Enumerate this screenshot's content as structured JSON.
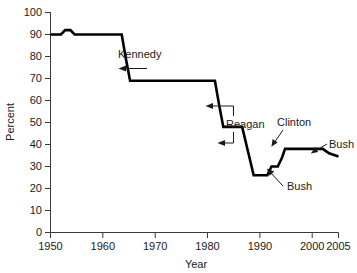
{
  "chart_data": {
    "type": "line",
    "title": "",
    "xlabel": "Year",
    "ylabel": "Percent",
    "xlim": [
      1950,
      2005
    ],
    "ylim": [
      0,
      100
    ],
    "grid": false,
    "legend": "none",
    "xticks": [
      1950,
      1960,
      1970,
      1980,
      1990,
      2000,
      2005
    ],
    "xtick_labels": [
      "1950",
      "1960",
      "1970",
      "1980",
      "1990",
      "2000",
      "2005"
    ],
    "yticks": [
      0,
      10,
      20,
      30,
      40,
      50,
      60,
      70,
      80,
      90,
      100
    ],
    "ytick_labels": [
      "0",
      "10",
      "20",
      "30",
      "40",
      "50",
      "60",
      "70",
      "80",
      "90",
      "100"
    ],
    "series": [
      {
        "name": "Percent",
        "color": "#000000",
        "x": [
          1950,
          1952,
          1952.8,
          1953.8,
          1954.6,
          1963.6,
          1964.4,
          1965.2,
          1981.4,
          1982.2,
          1983.0,
          1986.6,
          1987.4,
          1988.8,
          1991.4,
          1992.2,
          1993.4,
          1994.2,
          1994.8,
          1995.6,
          2002.0,
          2003.2,
          2005.0
        ],
        "y": [
          90,
          90,
          92,
          92,
          90,
          90,
          79,
          69,
          69,
          58,
          48,
          48,
          40,
          26,
          26,
          30,
          30,
          34,
          38,
          38,
          38,
          36,
          34.5
        ]
      }
    ],
    "annotations": [
      {
        "label": "Kennedy",
        "x": 1969.0,
        "y": 80.5,
        "points_to": {
          "x": 1965.2,
          "y": 73.0
        },
        "style": "arrow-left"
      },
      {
        "label": "Reagan",
        "x": 1988.5,
        "y": 49.0,
        "points_to": [
          {
            "x": 1982.4,
            "y": 57.0
          },
          {
            "x": 1986.9,
            "y": 40.5
          }
        ],
        "style": "bracket-two-arrows"
      },
      {
        "label": "Bush",
        "x": 1996.5,
        "y": 22.0,
        "points_to": {
          "x": 1992.2,
          "y": 29.0
        },
        "style": "arrow-up-left"
      },
      {
        "label": "Clinton",
        "x": 1996.2,
        "y": 48.0,
        "points_to": {
          "x": 1995.2,
          "y": 39.5
        },
        "style": "arrow-down-left"
      },
      {
        "label": "Bush",
        "x": 2004.0,
        "y": 41.0,
        "points_to": {
          "x": 2002.6,
          "y": 37.5
        },
        "style": "arrow-left"
      }
    ]
  }
}
